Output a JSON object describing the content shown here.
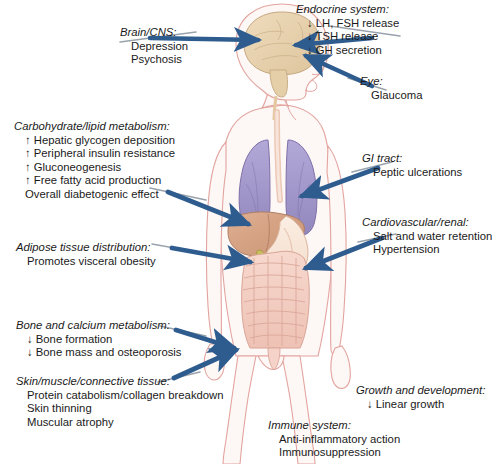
{
  "diagram": {
    "body_figure": {
      "name": "human-body-anatomical-figure",
      "orientation": "anterior torso with head in right profile",
      "organs": [
        "brain",
        "lungs",
        "liver",
        "gallbladder",
        "stomach",
        "small intestine",
        "large intestine",
        "trachea"
      ],
      "colors": {
        "outline": "#e8a9a4",
        "brain": "#e8d3b0",
        "lung": "#a79ccd",
        "liver": "#d8a98c",
        "stomach": "#f6e2d4",
        "intestine": "#f3ccc2",
        "gallbladder": "#c9c05a",
        "arrow": "#2f5c8f",
        "arrow_tail": "#9aa3ad",
        "background": "#ffffff"
      }
    },
    "callouts": [
      {
        "id": "brain-cns",
        "title": "Brain/CNS:",
        "lines": [
          "Depression",
          "Psychosis"
        ],
        "side": "left"
      },
      {
        "id": "endocrine-system",
        "title": "Endocrine system:",
        "lines": [
          "↓ LH, FSH release",
          "↓ TSH release",
          "↓ GH secretion"
        ],
        "side": "right"
      },
      {
        "id": "eye",
        "title": "Eye:",
        "lines": [
          "Glaucoma"
        ],
        "side": "right"
      },
      {
        "id": "carbohydrate-lipid-metabolism",
        "title": "Carbohydrate/lipid metabolism:",
        "lines": [
          "↑ Hepatic glycogen deposition",
          "↑ Peripheral insulin resistance",
          "↑ Gluconeogenesis",
          "↑ Free fatty acid production",
          "Overall diabetogenic effect"
        ],
        "side": "left"
      },
      {
        "id": "gi-tract",
        "title": "GI tract:",
        "lines": [
          "Peptic ulcerations"
        ],
        "side": "right"
      },
      {
        "id": "cardiovascular-renal",
        "title": "Cardiovascular/renal:",
        "lines": [
          "Salt and water retention",
          "Hypertension"
        ],
        "side": "right"
      },
      {
        "id": "adipose-tissue-distribution",
        "title": "Adipose tissue distribution:",
        "lines": [
          "Promotes visceral obesity"
        ],
        "side": "left"
      },
      {
        "id": "bone-and-calcium-metabolism",
        "title": "Bone and calcium metabolism:",
        "lines": [
          "↓ Bone formation",
          "↓ Bone mass and osteoporosis"
        ],
        "side": "left"
      },
      {
        "id": "skin-muscle-connective-tissue",
        "title": "Skin/muscle/connective tissue:",
        "lines": [
          "Protein catabolism/collagen breakdown",
          "Skin thinning",
          "Muscular atrophy"
        ],
        "side": "left"
      },
      {
        "id": "growth-and-development",
        "title": "Growth and development:",
        "lines": [
          "↓ Linear growth"
        ],
        "side": "right"
      },
      {
        "id": "immune-system",
        "title": "Immune system:",
        "lines": [
          "Anti-inflammatory action",
          "Immunosuppression"
        ],
        "side": "center"
      }
    ]
  }
}
